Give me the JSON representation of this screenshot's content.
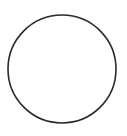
{
  "shape": {
    "type": "circle",
    "cx": 62,
    "cy": 69,
    "r": 54,
    "stroke": "#2a2a2a",
    "stroke_width": 1.6,
    "fill": "none"
  },
  "background": "#ffffff"
}
